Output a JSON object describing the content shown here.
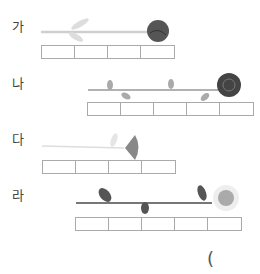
{
  "question": {
    "rows": [
      {
        "label": "가",
        "flower": "rose-short-stem",
        "cells": 4
      },
      {
        "label": "나",
        "flower": "rose-long-stem",
        "cells": 5
      },
      {
        "label": "다",
        "flower": "bellflower",
        "cells": 4
      },
      {
        "label": "라",
        "flower": "sunflower",
        "cells": 5
      }
    ],
    "answer_paren": "("
  }
}
